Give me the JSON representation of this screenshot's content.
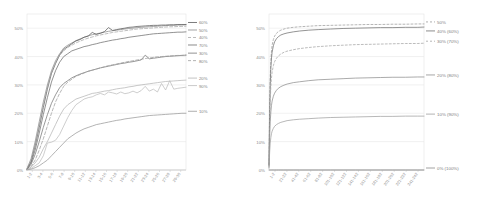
{
  "figure": {
    "background": "#ffffff",
    "panel_count": 2
  },
  "chart_data": [
    {
      "id": "left-chart",
      "type": "line",
      "title": "",
      "subtitle": "",
      "xlabel": "",
      "ylabel": "",
      "grid": true,
      "legend_position": "right",
      "ylim": [
        0,
        55
      ],
      "ytick_labels": [
        "50%",
        "40%",
        "30%",
        "20%",
        "10%",
        "0%"
      ],
      "ytick_values": [
        50,
        40,
        30,
        20,
        10,
        0
      ],
      "xtick_labels": [
        "1-2",
        "3-4",
        "5-6",
        "7-8",
        "9-10",
        "11-12",
        "13-14",
        "15-16",
        "17-18",
        "19-20",
        "21-22",
        "23-24",
        "25-26",
        "27-28",
        "29-30"
      ],
      "x": [
        1,
        2,
        3,
        4,
        5,
        6,
        7,
        8,
        9,
        10,
        11,
        12,
        13,
        14,
        15,
        16,
        17,
        18,
        19,
        20,
        21,
        22,
        23,
        24,
        25,
        26,
        27,
        28,
        29,
        30,
        31,
        32,
        33,
        34,
        35,
        36,
        37,
        38,
        39,
        40
      ],
      "series": [
        {
          "name": "50%",
          "color": "#8c8c8c",
          "dash": "none",
          "values": [
            0.5,
            4,
            10,
            17,
            24,
            30,
            35,
            38.5,
            41,
            43,
            44,
            44.8,
            45.6,
            46.2,
            46.8,
            47.3,
            47.7,
            48,
            48.3,
            48.6,
            48.9,
            49.1,
            49.3,
            49.5,
            49.7,
            49.9,
            50,
            50.2,
            50.3,
            50.4,
            50.5,
            50.6,
            50.7,
            50.8,
            50.9,
            51,
            51,
            51.1,
            51.1,
            51.2
          ]
        },
        {
          "name": "60%",
          "color": "#5a5a5a",
          "dash": "none",
          "values": [
            0.3,
            3,
            8.5,
            15,
            22,
            28.5,
            34,
            37.5,
            40.5,
            42.5,
            43.5,
            44.5,
            45.5,
            46,
            46.8,
            47.2,
            48.5,
            47.8,
            48.2,
            48.8,
            50.2,
            49.2,
            49.5,
            49.8,
            50,
            50.3,
            50.4,
            50.6,
            50.7,
            50.8,
            50.9,
            51,
            51,
            51.1,
            51.1,
            51.2,
            51.2,
            51.3,
            51.3,
            51.3
          ]
        },
        {
          "name": "70%",
          "color": "#6e6e6e",
          "dash": "none",
          "values": [
            0.2,
            2.5,
            7,
            13,
            19.5,
            25.5,
            31,
            35,
            38,
            40,
            41,
            42,
            42.5,
            43,
            43.5,
            43.8,
            44.2,
            44.5,
            44.9,
            45.2,
            45.5,
            45.8,
            46,
            46.3,
            46.5,
            46.8,
            47,
            47.2,
            47.4,
            47.6,
            47.8,
            48,
            48.1,
            48.2,
            48.3,
            48.4,
            48.5,
            48.6,
            48.6,
            48.7
          ]
        },
        {
          "name": "40%",
          "color": "#a8a8a8",
          "dash": "3,2",
          "values": [
            0.4,
            3.5,
            9,
            16,
            23,
            29,
            34.5,
            38,
            40.5,
            42,
            43.2,
            44,
            44.8,
            45.4,
            46,
            46.5,
            46.9,
            47.3,
            47.6,
            47.9,
            48.2,
            48.5,
            48.7,
            48.9,
            49.1,
            49.3,
            49.5,
            49.7,
            49.8,
            49.9,
            50,
            50.1,
            50.2,
            50.3,
            50.4,
            50.5,
            50.5,
            50.6,
            50.6,
            50.7
          ]
        },
        {
          "name": "30%",
          "color": "#777777",
          "dash": "none",
          "values": [
            0.2,
            2,
            5.5,
            10,
            15,
            19.5,
            23.5,
            26.5,
            29,
            30.5,
            31.5,
            32.5,
            33.2,
            33.8,
            34.3,
            34.8,
            35.2,
            35.6,
            36,
            36.3,
            36.6,
            36.9,
            37.2,
            37.5,
            37.7,
            38,
            38.2,
            38.5,
            38.8,
            40.5,
            39.2,
            39.4,
            39.6,
            39.8,
            40,
            40.1,
            40.2,
            40.3,
            40.4,
            40.5
          ]
        },
        {
          "name": "80%",
          "color": "#9e9e9e",
          "dash": "3,2",
          "values": [
            0.1,
            1.2,
            3.5,
            7,
            11,
            15.5,
            20,
            24,
            27,
            29.5,
            31,
            32,
            33,
            33.6,
            34.2,
            34.8,
            35.2,
            35.6,
            36,
            36.4,
            36.8,
            37.1,
            37.4,
            37.7,
            38,
            38.3,
            38.5,
            38.8,
            39,
            39.3,
            39.5,
            39.7,
            39.9,
            40,
            40.1,
            40.2,
            40.3,
            40.4,
            40.4,
            40.5
          ]
        },
        {
          "name": "20%",
          "color": "#b5b5b5",
          "dash": "none",
          "values": [
            0.1,
            1,
            2.5,
            4.5,
            7.5,
            10,
            13,
            16,
            19,
            21.5,
            23,
            24,
            25,
            25.5,
            26,
            26.5,
            27,
            27.2,
            27.5,
            27.8,
            28,
            28.3,
            28.6,
            28.8,
            29,
            29.3,
            29.5,
            29.8,
            30,
            30.2,
            30.4,
            30.6,
            30.8,
            31,
            31.2,
            31.3,
            31.4,
            31.5,
            31.6,
            31.7
          ]
        },
        {
          "name": "90%",
          "color": "#bdbdbd",
          "dash": "none",
          "values": [
            0.1,
            0.6,
            1.5,
            2.5,
            5,
            9.5,
            9.8,
            10.5,
            12.5,
            15.5,
            18.5,
            21,
            23,
            24,
            25,
            25.5,
            25.8,
            26.5,
            27,
            26.5,
            27.5,
            27.2,
            26.8,
            27.5,
            26.9,
            27.2,
            27.8,
            27.2,
            28,
            29.5,
            27.8,
            28.5,
            27.5,
            30.5,
            28.2,
            31.5,
            28.5,
            28.8,
            29,
            29.2
          ]
        },
        {
          "name": "10%",
          "color": "#9a9a9a",
          "dash": "none",
          "values": [
            0.05,
            0.3,
            0.8,
            1.5,
            2.5,
            3.5,
            5,
            6.5,
            8,
            9.5,
            11,
            12,
            13,
            13.8,
            14.5,
            15,
            15.5,
            16,
            16.3,
            16.6,
            16.9,
            17.2,
            17.5,
            17.7,
            18,
            18.2,
            18.4,
            18.6,
            18.8,
            19,
            19.2,
            19.3,
            19.4,
            19.5,
            19.6,
            19.7,
            19.8,
            19.9,
            20,
            20
          ]
        }
      ]
    },
    {
      "id": "right-chart",
      "type": "line",
      "title": "",
      "subtitle": "",
      "xlabel": "",
      "ylabel": "",
      "grid": true,
      "legend_position": "right",
      "ylim": [
        0,
        55
      ],
      "ytick_labels": [
        "50%",
        "40%",
        "30%",
        "20%",
        "10%",
        "0%"
      ],
      "ytick_values": [
        50,
        40,
        30,
        20,
        10,
        0
      ],
      "xtick_labels": [
        "1-2",
        "21-22",
        "41-42",
        "61-62",
        "81-82",
        "101-102",
        "121-122",
        "141-142",
        "161-162",
        "181-182",
        "201-202",
        "221-222",
        "241-242"
      ],
      "x": [
        1,
        2,
        3,
        4,
        5,
        6,
        8,
        10,
        13,
        16,
        20,
        25,
        30,
        40,
        50,
        65,
        80,
        100,
        120,
        140,
        160,
        180,
        200,
        220,
        240,
        250
      ],
      "series": [
        {
          "name": "50%",
          "color": "#9c9c9c",
          "dash": "2,2",
          "values": [
            2,
            22,
            33,
            38.5,
            42,
            44,
            46,
            47.2,
            48.2,
            48.8,
            49.3,
            49.7,
            50,
            50.3,
            50.5,
            50.7,
            50.9,
            51,
            51.1,
            51.2,
            51.3,
            51.3,
            51.4,
            51.4,
            51.5,
            51.5
          ]
        },
        {
          "name": "40% (60%)",
          "color": "#707070",
          "dash": "none",
          "values": [
            1.8,
            20,
            30.5,
            36,
            39.5,
            41.5,
            43.8,
            45.2,
            46.3,
            47,
            47.6,
            48,
            48.3,
            48.7,
            49,
            49.3,
            49.5,
            49.7,
            49.9,
            50,
            50.1,
            50.2,
            50.2,
            50.3,
            50.3,
            50.4
          ]
        },
        {
          "name": "30% (70%)",
          "color": "#a5a5a5",
          "dash": "2,2",
          "values": [
            1.5,
            16,
            24.5,
            29.5,
            32.5,
            34.5,
            36.8,
            38.2,
            39.4,
            40.2,
            40.9,
            41.5,
            41.9,
            42.4,
            42.8,
            43.2,
            43.5,
            43.8,
            44,
            44.2,
            44.3,
            44.4,
            44.5,
            44.6,
            44.6,
            44.7
          ]
        },
        {
          "name": "20% (80%)",
          "color": "#8f8f8f",
          "dash": "none",
          "values": [
            1,
            11,
            17,
            20.5,
            22.8,
            24.3,
            26,
            27.1,
            28.1,
            28.8,
            29.4,
            29.9,
            30.3,
            30.8,
            31.1,
            31.5,
            31.8,
            32,
            32.2,
            32.4,
            32.5,
            32.6,
            32.7,
            32.7,
            32.8,
            32.8
          ]
        },
        {
          "name": "10% (90%)",
          "color": "#a0a0a0",
          "dash": "none",
          "values": [
            0.6,
            6,
            9.5,
            11.5,
            12.8,
            13.7,
            14.7,
            15.4,
            16,
            16.4,
            16.8,
            17.1,
            17.4,
            17.7,
            17.9,
            18.1,
            18.3,
            18.5,
            18.6,
            18.7,
            18.8,
            18.9,
            18.9,
            19,
            19,
            19
          ]
        },
        {
          "name": "0% (100%)",
          "color": "#8a8a8a",
          "dash": "none",
          "values": [
            0,
            0,
            0,
            0,
            0,
            0,
            0,
            0,
            0,
            0,
            0,
            0,
            0,
            0,
            0,
            0,
            0,
            0,
            0,
            0,
            0,
            0,
            0,
            0,
            0,
            0
          ]
        }
      ]
    }
  ]
}
